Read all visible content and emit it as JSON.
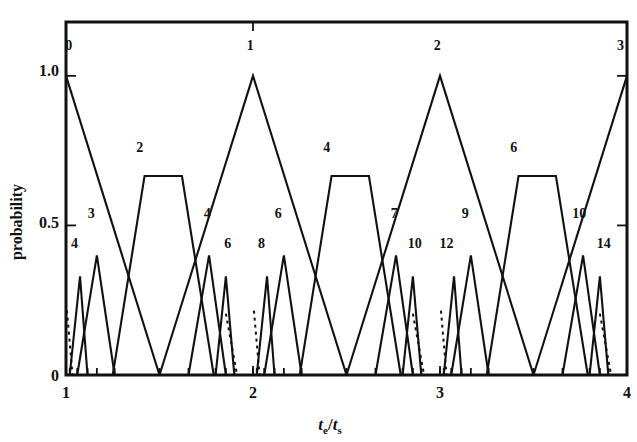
{
  "chart_data": {
    "type": "line",
    "title": "",
    "subtitle": "",
    "xlabel": "t_e/t_s",
    "xlabel_parts": {
      "base1": "t",
      "sub1": "e",
      "slash": "/",
      "base2": "t",
      "sub2": "s"
    },
    "ylabel": "probability",
    "xlim": [
      1,
      4
    ],
    "ylim": [
      0,
      1.18
    ],
    "xticks": [
      1,
      2,
      3,
      4
    ],
    "xticklabels": [
      "1",
      "2",
      "3",
      "4"
    ],
    "yticks": [
      0,
      0.5,
      1.0
    ],
    "yticklabels": [
      "0",
      "0.5",
      "1.0"
    ],
    "grid": false,
    "legend": "none",
    "annotations": "Each curve is labelled with its integer index; curves are piecewise-linear triangular or trapezoidal probability profiles.",
    "series": [
      {
        "name": "0",
        "label": "0",
        "label_x": 1.015,
        "label_y": 1.085,
        "style": "solid",
        "points": [
          [
            1.0,
            1.0
          ],
          [
            1.5,
            0.0
          ]
        ]
      },
      {
        "name": "2",
        "label": "2",
        "label_x": 1.395,
        "label_y": 0.745,
        "style": "solid",
        "points": [
          [
            1.25,
            0.0
          ],
          [
            1.42,
            0.665
          ],
          [
            1.62,
            0.665
          ],
          [
            1.79,
            0.0
          ]
        ]
      },
      {
        "name": "1",
        "label": "1",
        "label_x": 1.985,
        "label_y": 1.085,
        "style": "solid",
        "points": [
          [
            1.5,
            0.0
          ],
          [
            2.0,
            1.0
          ],
          [
            2.5,
            0.0
          ]
        ]
      },
      {
        "name": "4",
        "label": "4",
        "label_x": 2.395,
        "label_y": 0.745,
        "style": "solid",
        "points": [
          [
            2.25,
            0.0
          ],
          [
            2.42,
            0.665
          ],
          [
            2.62,
            0.665
          ],
          [
            2.79,
            0.0
          ]
        ]
      },
      {
        "name": "2b",
        "label": "2",
        "label_x": 2.985,
        "label_y": 1.085,
        "style": "solid",
        "points": [
          [
            2.5,
            0.0
          ],
          [
            3.0,
            1.0
          ],
          [
            3.5,
            0.0
          ]
        ]
      },
      {
        "name": "6",
        "label": "6",
        "label_x": 3.395,
        "label_y": 0.745,
        "style": "solid",
        "points": [
          [
            3.25,
            0.0
          ],
          [
            3.42,
            0.665
          ],
          [
            3.62,
            0.665
          ],
          [
            3.79,
            0.0
          ]
        ]
      },
      {
        "name": "3",
        "label": "3",
        "label_x": 3.965,
        "label_y": 1.085,
        "style": "solid",
        "points": [
          [
            3.5,
            0.0
          ],
          [
            4.0,
            1.0
          ]
        ]
      },
      {
        "name": "4s",
        "label": "4",
        "label_x": 1.045,
        "label_y": 0.425,
        "style": "solid",
        "points": [
          [
            1.02,
            0.0
          ],
          [
            1.075,
            0.33
          ],
          [
            1.115,
            0.0
          ]
        ]
      },
      {
        "name": "3s",
        "label": "3",
        "label_x": 1.135,
        "label_y": 0.525,
        "style": "solid",
        "points": [
          [
            1.06,
            0.0
          ],
          [
            1.165,
            0.4
          ],
          [
            1.26,
            0.0
          ]
        ]
      },
      {
        "name": "4r",
        "label": "4",
        "label_x": 1.755,
        "label_y": 0.525,
        "style": "solid",
        "points": [
          [
            1.655,
            0.0
          ],
          [
            1.765,
            0.4
          ],
          [
            1.855,
            0.0
          ]
        ]
      },
      {
        "name": "6r",
        "label": "6",
        "label_x": 1.865,
        "label_y": 0.425,
        "style": "solid",
        "points": [
          [
            1.8,
            0.0
          ],
          [
            1.855,
            0.33
          ],
          [
            1.9,
            0.0
          ]
        ]
      },
      {
        "name": "8s",
        "label": "8",
        "label_x": 2.045,
        "label_y": 0.425,
        "style": "solid",
        "points": [
          [
            2.02,
            0.0
          ],
          [
            2.075,
            0.33
          ],
          [
            2.115,
            0.0
          ]
        ]
      },
      {
        "name": "6s",
        "label": "6",
        "label_x": 2.135,
        "label_y": 0.525,
        "style": "solid",
        "points": [
          [
            2.06,
            0.0
          ],
          [
            2.165,
            0.4
          ],
          [
            2.26,
            0.0
          ]
        ]
      },
      {
        "name": "7r",
        "label": "7",
        "label_x": 2.755,
        "label_y": 0.525,
        "style": "solid",
        "points": [
          [
            2.655,
            0.0
          ],
          [
            2.765,
            0.4
          ],
          [
            2.855,
            0.0
          ]
        ]
      },
      {
        "name": "10r",
        "label": "10",
        "label_x": 2.865,
        "label_y": 0.425,
        "style": "solid",
        "points": [
          [
            2.8,
            0.0
          ],
          [
            2.855,
            0.33
          ],
          [
            2.9,
            0.0
          ]
        ]
      },
      {
        "name": "12s",
        "label": "12",
        "label_x": 3.035,
        "label_y": 0.425,
        "style": "solid",
        "points": [
          [
            3.02,
            0.0
          ],
          [
            3.075,
            0.33
          ],
          [
            3.115,
            0.0
          ]
        ]
      },
      {
        "name": "9s",
        "label": "9",
        "label_x": 3.135,
        "label_y": 0.525,
        "style": "solid",
        "points": [
          [
            3.06,
            0.0
          ],
          [
            3.165,
            0.4
          ],
          [
            3.26,
            0.0
          ]
        ]
      },
      {
        "name": "10g",
        "label": "10",
        "label_x": 3.745,
        "label_y": 0.525,
        "style": "solid",
        "points": [
          [
            3.655,
            0.0
          ],
          [
            3.765,
            0.4
          ],
          [
            3.855,
            0.0
          ]
        ]
      },
      {
        "name": "14g",
        "label": "14",
        "label_x": 3.875,
        "label_y": 0.425,
        "style": "solid",
        "points": [
          [
            3.8,
            0.0
          ],
          [
            3.855,
            0.33
          ],
          [
            3.9,
            0.0
          ]
        ]
      }
    ],
    "dashed_series": [
      {
        "name": "dashed-1",
        "points": [
          [
            1.005,
            0.215
          ],
          [
            1.035,
            0.0
          ]
        ]
      },
      {
        "name": "dashed-2",
        "points": [
          [
            1.855,
            0.205
          ],
          [
            1.915,
            0.0
          ]
        ]
      },
      {
        "name": "dashed-3",
        "points": [
          [
            2.005,
            0.215
          ],
          [
            2.035,
            0.0
          ]
        ]
      },
      {
        "name": "dashed-4",
        "points": [
          [
            2.855,
            0.205
          ],
          [
            2.915,
            0.0
          ]
        ]
      },
      {
        "name": "dashed-5",
        "points": [
          [
            3.005,
            0.215
          ],
          [
            3.035,
            0.0
          ]
        ]
      },
      {
        "name": "dashed-6",
        "points": [
          [
            3.855,
            0.205
          ],
          [
            3.915,
            0.0
          ]
        ]
      }
    ],
    "minor_xticks": [
      1.02,
      1.06,
      1.115,
      1.165,
      1.26,
      1.5,
      1.655,
      1.8,
      1.855,
      1.9,
      2.0,
      2.02,
      2.06,
      2.115,
      2.165,
      2.26,
      2.5,
      2.655,
      2.8,
      2.855,
      2.9,
      3.0,
      3.02,
      3.06,
      3.115,
      3.165,
      3.26,
      3.5,
      3.655,
      3.8,
      3.855,
      3.9
    ]
  },
  "figure": {
    "caption": ""
  }
}
